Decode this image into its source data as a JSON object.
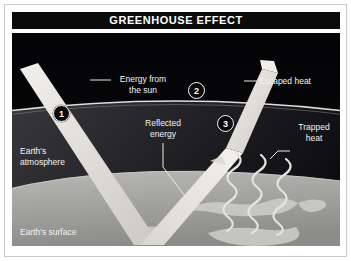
{
  "figure": {
    "title": "GREENHOUSE EFFECT",
    "background_color": "#050508",
    "title_bar_color": "#0b0b0b",
    "text_color": "#f2f2f2",
    "ray_color": "#e8e6e0"
  },
  "labels": {
    "energy_from_sun": "Energy from\nthe sun",
    "escaped_heat": "Escaped heat",
    "reflected_energy": "Reflected\nenergy",
    "trapped_heat": "Trapped\nheat",
    "earths_atmosphere": "Earth's\natmosphere",
    "earths_surface": "Earth's surface"
  },
  "callouts": [
    {
      "id": "1",
      "number": "1"
    },
    {
      "id": "2",
      "number": "2"
    },
    {
      "id": "3",
      "number": "3"
    }
  ]
}
